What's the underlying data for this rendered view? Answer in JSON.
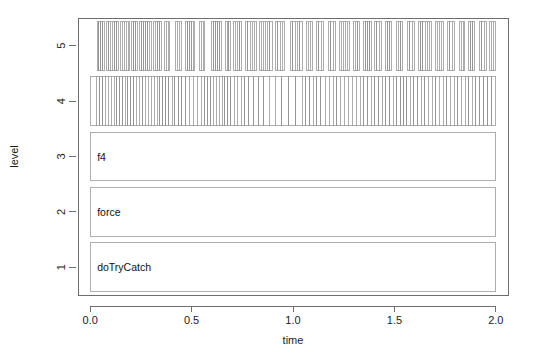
{
  "chart_data": {
    "type": "bar",
    "title": "",
    "subtitle": "",
    "xlabel": "time",
    "ylabel": "level",
    "xlim": [
      -0.06,
      2.06
    ],
    "ylim": [
      0.5,
      5.5
    ],
    "xticks": [
      0.0,
      0.5,
      1.0,
      1.5,
      2.0
    ],
    "xtick_labels": [
      "0.0",
      "0.5",
      "1.0",
      "1.5",
      "2.0"
    ],
    "yticks": [
      1,
      2,
      3,
      4,
      5
    ],
    "ytick_labels": [
      "1",
      "2",
      "3",
      "4",
      "5"
    ],
    "grid": false,
    "legend": null,
    "legend_position": "none",
    "levels": [
      {
        "level": 1,
        "label": "doTryCatch",
        "y_bottom": 0.56,
        "y_top": 1.44,
        "blocks": [
          {
            "start": 0.0,
            "end": 2.0,
            "label": "doTryCatch"
          }
        ]
      },
      {
        "level": 2,
        "label": "force",
        "y_bottom": 1.56,
        "y_top": 2.44,
        "blocks": [
          {
            "start": 0.0,
            "end": 2.0,
            "label": "force"
          }
        ]
      },
      {
        "level": 3,
        "label": "f4",
        "y_bottom": 2.56,
        "y_top": 3.44,
        "blocks": [
          {
            "start": 0.0,
            "end": 2.0,
            "label": "f4"
          }
        ]
      },
      {
        "level": 4,
        "label": "",
        "y_bottom": 3.56,
        "y_top": 4.44,
        "segment_edges": [
          0.0,
          0.03,
          0.047,
          0.061,
          0.074,
          0.09,
          0.104,
          0.118,
          0.131,
          0.146,
          0.16,
          0.174,
          0.186,
          0.2,
          0.214,
          0.228,
          0.241,
          0.258,
          0.272,
          0.286,
          0.3,
          0.316,
          0.33,
          0.344,
          0.358,
          0.373,
          0.388,
          0.404,
          0.418,
          0.436,
          0.452,
          0.47,
          0.489,
          0.508,
          0.528,
          0.548,
          0.566,
          0.58,
          0.594,
          0.608,
          0.622,
          0.636,
          0.65,
          0.664,
          0.678,
          0.694,
          0.71,
          0.726,
          0.744,
          0.762,
          0.782,
          0.806,
          0.83,
          0.856,
          0.884,
          0.912,
          0.944,
          0.978,
          1.014,
          1.046,
          1.064,
          1.082,
          1.1,
          1.118,
          1.138,
          1.158,
          1.178,
          1.198,
          1.216,
          1.234,
          1.252,
          1.272,
          1.292,
          1.312,
          1.332,
          1.35,
          1.368,
          1.386,
          1.404,
          1.422,
          1.44,
          1.458,
          1.476,
          1.494,
          1.512,
          1.53,
          1.546,
          1.562,
          1.578,
          1.596,
          1.614,
          1.632,
          1.65,
          1.668,
          1.686,
          1.704,
          1.722,
          1.74,
          1.758,
          1.776,
          1.794,
          1.812,
          1.83,
          1.848,
          1.866,
          1.884,
          1.902,
          1.92,
          1.94,
          1.96,
          1.98,
          2.0
        ]
      },
      {
        "level": 5,
        "label": "",
        "y_bottom": 4.56,
        "y_top": 5.44,
        "blocks": [
          {
            "start": 0.034,
            "end": 0.072,
            "edges": [
              0.034,
              0.043,
              0.052,
              0.061,
              0.072
            ]
          },
          {
            "start": 0.082,
            "end": 0.14,
            "edges": [
              0.082,
              0.091,
              0.1,
              0.11,
              0.12,
              0.13,
              0.14
            ]
          },
          {
            "start": 0.148,
            "end": 0.196,
            "edges": [
              0.148,
              0.158,
              0.168,
              0.178,
              0.188,
              0.196
            ]
          },
          {
            "start": 0.206,
            "end": 0.232,
            "edges": [
              0.206,
              0.215,
              0.224,
              0.232
            ]
          },
          {
            "start": 0.244,
            "end": 0.3,
            "edges": [
              0.244,
              0.254,
              0.264,
              0.274,
              0.284,
              0.292,
              0.3
            ]
          },
          {
            "start": 0.312,
            "end": 0.352,
            "edges": [
              0.312,
              0.322,
              0.332,
              0.342,
              0.352
            ]
          },
          {
            "start": 0.366,
            "end": 0.392,
            "edges": [
              0.366,
              0.375,
              0.384,
              0.392
            ]
          },
          {
            "start": 0.42,
            "end": 0.452,
            "edges": [
              0.42,
              0.43,
              0.44,
              0.452
            ]
          },
          {
            "start": 0.47,
            "end": 0.516,
            "edges": [
              0.47,
              0.48,
              0.49,
              0.5,
              0.508,
              0.516
            ]
          },
          {
            "start": 0.538,
            "end": 0.566,
            "edges": [
              0.538,
              0.548,
              0.558,
              0.566
            ]
          },
          {
            "start": 0.6,
            "end": 0.648,
            "edges": [
              0.6,
              0.61,
              0.62,
              0.63,
              0.64,
              0.648
            ]
          },
          {
            "start": 0.666,
            "end": 0.69,
            "edges": [
              0.666,
              0.675,
              0.684,
              0.69
            ]
          },
          {
            "start": 0.706,
            "end": 0.748,
            "edges": [
              0.706,
              0.716,
              0.726,
              0.738,
              0.748
            ]
          },
          {
            "start": 0.768,
            "end": 0.818,
            "edges": [
              0.768,
              0.778,
              0.788,
              0.798,
              0.808,
              0.818
            ]
          },
          {
            "start": 0.834,
            "end": 0.898,
            "edges": [
              0.834,
              0.844,
              0.854,
              0.864,
              0.874,
              0.886,
              0.898
            ]
          },
          {
            "start": 0.916,
            "end": 0.96,
            "edges": [
              0.916,
              0.926,
              0.936,
              0.948,
              0.96
            ]
          },
          {
            "start": 0.988,
            "end": 1.046,
            "edges": [
              0.988,
              0.998,
              1.01,
              1.022,
              1.034,
              1.046
            ]
          },
          {
            "start": 1.066,
            "end": 1.096,
            "edges": [
              1.066,
              1.076,
              1.086,
              1.096
            ]
          },
          {
            "start": 1.118,
            "end": 1.15,
            "edges": [
              1.118,
              1.128,
              1.14,
              1.15
            ]
          },
          {
            "start": 1.176,
            "end": 1.208,
            "edges": [
              1.176,
              1.186,
              1.198,
              1.208
            ]
          },
          {
            "start": 1.228,
            "end": 1.278,
            "edges": [
              1.228,
              1.238,
              1.248,
              1.258,
              1.268,
              1.278
            ]
          },
          {
            "start": 1.298,
            "end": 1.33,
            "edges": [
              1.298,
              1.308,
              1.32,
              1.33
            ]
          },
          {
            "start": 1.348,
            "end": 1.386,
            "edges": [
              1.348,
              1.358,
              1.368,
              1.378,
              1.386
            ]
          },
          {
            "start": 1.402,
            "end": 1.434,
            "edges": [
              1.402,
              1.412,
              1.424,
              1.434
            ]
          },
          {
            "start": 1.456,
            "end": 1.486,
            "edges": [
              1.456,
              1.466,
              1.476,
              1.486
            ]
          },
          {
            "start": 1.51,
            "end": 1.542,
            "edges": [
              1.51,
              1.52,
              1.532,
              1.542
            ]
          },
          {
            "start": 1.566,
            "end": 1.6,
            "edges": [
              1.566,
              1.576,
              1.588,
              1.6
            ]
          },
          {
            "start": 1.62,
            "end": 1.684,
            "edges": [
              1.62,
              1.63,
              1.64,
              1.652,
              1.662,
              1.672,
              1.684
            ]
          },
          {
            "start": 1.702,
            "end": 1.742,
            "edges": [
              1.702,
              1.712,
              1.722,
              1.732,
              1.742
            ]
          },
          {
            "start": 1.762,
            "end": 1.796,
            "edges": [
              1.762,
              1.772,
              1.784,
              1.796
            ]
          },
          {
            "start": 1.82,
            "end": 1.846,
            "edges": [
              1.82,
              1.83,
              1.84,
              1.846
            ]
          },
          {
            "start": 1.866,
            "end": 1.896,
            "edges": [
              1.866,
              1.876,
              1.886,
              1.896
            ]
          },
          {
            "start": 1.92,
            "end": 1.952,
            "edges": [
              1.92,
              1.93,
              1.942,
              1.952
            ]
          },
          {
            "start": 1.968,
            "end": 1.996,
            "edges": [
              1.968,
              1.978,
              1.988,
              1.996
            ]
          }
        ]
      }
    ]
  },
  "axes": {
    "x_title": "time",
    "y_title": "level"
  },
  "colors": {
    "background": "#ffffff",
    "frame": "#6e6e6e",
    "cell_stroke": "#8a8a8a",
    "cell_fill": "#ffffff",
    "text": "#1c1c1c"
  }
}
